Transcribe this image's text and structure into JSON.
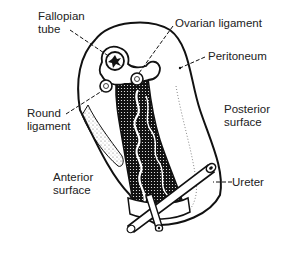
{
  "diagram": {
    "labels": {
      "fallopian_tube": [
        "Fallopian",
        "tube"
      ],
      "ovarian_ligament": "Ovarian ligament",
      "peritoneum": "Peritoneum",
      "round_ligament": [
        "Round",
        "ligament"
      ],
      "posterior_surface": [
        "Posterior",
        "surface"
      ],
      "anterior_surface": [
        "Anterior",
        "surface"
      ],
      "ureter": "Ureter"
    },
    "colors": {
      "ink": "#111111",
      "background": "#ffffff",
      "text": "#222222"
    }
  }
}
